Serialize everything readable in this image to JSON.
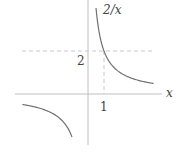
{
  "chart_data": {
    "type": "line",
    "title": "",
    "function": "2/x",
    "series": [
      {
        "name": "2/x",
        "branch": "positive",
        "x": [
          0.5,
          0.75,
          1,
          1.5,
          2,
          3,
          4.1
        ],
        "y": [
          4,
          2.667,
          2,
          1.333,
          1,
          0.667,
          0.488
        ]
      },
      {
        "name": "2/x",
        "branch": "negative",
        "x": [
          -4.1,
          -3,
          -2,
          -1.5,
          -1
        ],
        "y": [
          -0.488,
          -0.667,
          -1,
          -1.333,
          -2
        ]
      }
    ],
    "xlabel": "x",
    "curve_label": "2/x",
    "annotations": [
      {
        "type": "dashed-hline",
        "y": 2
      },
      {
        "type": "dashed-vline",
        "x": 1,
        "from_y": 0,
        "to_y": 2
      }
    ],
    "tick_labels": {
      "x": [
        "1"
      ],
      "y": [
        "2"
      ]
    },
    "grid": false,
    "colors": {
      "axis": "#bdbdbd",
      "curve": "#6e6e6e",
      "dash": "#c4c4c4",
      "text": "#444444"
    }
  },
  "labels": {
    "curve": "2/x",
    "x_axis": "x",
    "x_tick": "1",
    "y_tick": "2"
  }
}
